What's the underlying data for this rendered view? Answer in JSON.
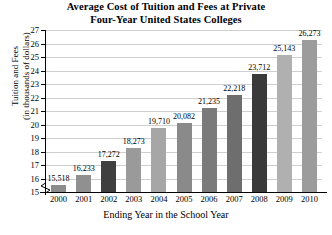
{
  "chart_data": {
    "type": "bar",
    "title": "Average Cost of Tuition and Fees at Private Four-Year United States Colleges",
    "title_lines": [
      "Average Cost of Tuition and Fees at Private",
      "Four-Year United States Colleges"
    ],
    "xlabel": "Ending Year in the School Year",
    "ylabel": "Tuition and Fees (in thousands of dollars)",
    "ylabel_lines": [
      "Tuition and Fees",
      "(in thousands of dollars)"
    ],
    "categories": [
      "2000",
      "2001",
      "2002",
      "2003",
      "2004",
      "2005",
      "2006",
      "2007",
      "2008",
      "2009",
      "2010"
    ],
    "values": [
      15518,
      16233,
      17272,
      18273,
      19710,
      20082,
      21235,
      22218,
      23712,
      25143,
      26273
    ],
    "value_labels": [
      "15,518",
      "16,233",
      "17,272",
      "18,273",
      "19,710",
      "20,082",
      "21,235",
      "22,218",
      "23,712",
      "25,143",
      "26,273"
    ],
    "bar_colors": [
      "#8c8c8c",
      "#909090",
      "#3f3f3f",
      "#9a9a9a",
      "#a6a6a6",
      "#8a8a8a",
      "#7a7a7a",
      "#6e6e6e",
      "#3a3a3a",
      "#b0b0b0",
      "#9c9c9c"
    ],
    "ylim": [
      15,
      27
    ],
    "ytick_labels": [
      "15",
      "16",
      "17",
      "18",
      "19",
      "20",
      "21",
      "22",
      "23",
      "24",
      "25",
      "26",
      "27"
    ],
    "ytick_values": [
      15,
      16,
      17,
      18,
      19,
      20,
      21,
      22,
      23,
      24,
      25,
      26,
      27
    ],
    "y_unit_scale": 1000,
    "grid": true,
    "grid_color": "#cfcfcf",
    "axis_color": "#000000",
    "axis_break": true,
    "legend": null,
    "background": "#ffffff"
  }
}
